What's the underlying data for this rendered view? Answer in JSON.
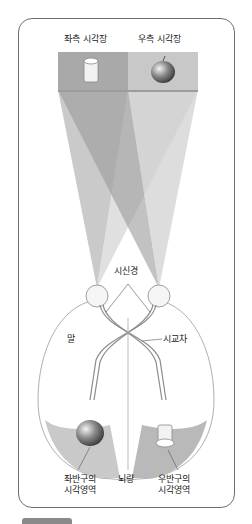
{
  "diagram": {
    "type": "visual-pathway",
    "labels": {
      "left_visual_field": "좌측 시각장",
      "right_visual_field": "우측 시각장",
      "optic_nerve": "시신경",
      "side_label": "말",
      "optic_chiasm": "시교차",
      "left_visual_cortex_line1": "좌반구의",
      "left_visual_cortex_line2": "시각영역",
      "corpus_callosum": "뇌량",
      "right_visual_cortex_line1": "우반구의",
      "right_visual_cortex_line2": "시각영역"
    },
    "objects": {
      "left_field_object": "cup-icon",
      "right_field_object": "apple-icon",
      "left_cortex_object": "apple-icon",
      "right_cortex_object": "cup-icon"
    },
    "colors": {
      "left_field_box": "#a9a9a9",
      "right_field_box": "#c8c8c8",
      "dark_beam": "#9a9a9a",
      "light_beam": "#cfcfcf",
      "frame_border": "#6e6e6e",
      "cortex_fill": "#c9c9c9",
      "nerve_stroke": "#8c8c8c"
    }
  }
}
